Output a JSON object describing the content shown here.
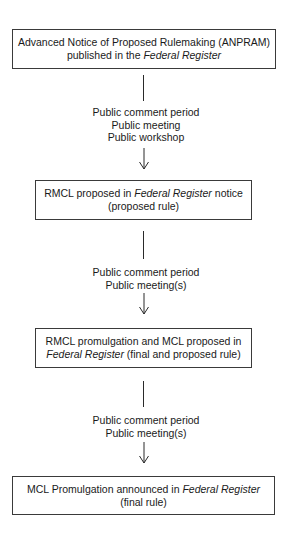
{
  "diagram": {
    "type": "flowchart",
    "steps": [
      {
        "id": "anpram",
        "line1": "Advanced Notice of Proposed Rulemaking (ANPRAM)",
        "line2_prefix": "published in the ",
        "line2_italic": "Federal Register",
        "line2_suffix": ""
      },
      {
        "id": "rmcl-proposed",
        "line1_prefix": "RMCL proposed in ",
        "line1_italic": "Federal Register",
        "line1_suffix": " notice",
        "line2": "(proposed rule)"
      },
      {
        "id": "rmcl-promulgation",
        "line1": "RMCL promulgation and MCL proposed in",
        "line2_italic": "Federal Register",
        "line2_suffix": " (final and proposed rule)"
      },
      {
        "id": "mcl-promulgation",
        "line1_prefix": "MCL Promulgation announced in ",
        "line1_italic": "Federal Register",
        "line2": "(final rule)"
      }
    ],
    "transitions": [
      {
        "lines": [
          "Public comment period",
          "Public meeting",
          "Public workshop"
        ]
      },
      {
        "lines": [
          "Public comment period",
          "Public meeting(s)"
        ]
      },
      {
        "lines": [
          "Public comment period",
          "Public meeting(s)"
        ]
      }
    ]
  }
}
